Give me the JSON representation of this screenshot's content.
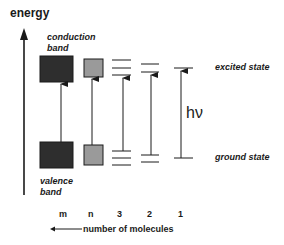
{
  "diagram": {
    "y_axis_label": "energy",
    "conduction_band_label": [
      "conduction",
      "band"
    ],
    "valence_band_label": [
      "valence",
      "band"
    ],
    "excited_state_label": "excited state",
    "ground_state_label": "ground state",
    "photon_label": "hν",
    "x_labels": [
      "m",
      "n",
      "3",
      "2",
      "1"
    ],
    "x_axis_caption": "number  of  molecules",
    "arrow_direction_glyph": "<——",
    "colors": {
      "line": "#1a1a1a",
      "band_m": "#2e2e2e",
      "band_n": "#9a9a9a",
      "background": "#ffffff"
    }
  }
}
